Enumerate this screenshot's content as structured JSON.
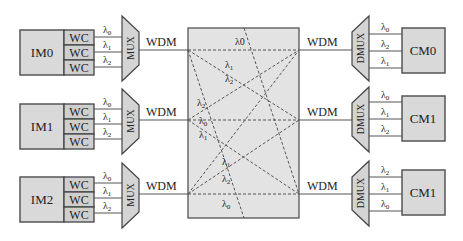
{
  "diagram": {
    "type": "optical-switch-architecture",
    "crossbar": {
      "fill": "#e3e3e3"
    },
    "inputs": [
      {
        "module": "IM0",
        "converters": [
          "WC",
          "WC",
          "WC"
        ],
        "wavelengths": [
          "λ0",
          "λ1",
          "λ2"
        ],
        "mux": "MUX",
        "link": "WDM"
      },
      {
        "module": "IM1",
        "converters": [
          "WC",
          "WC",
          "WC"
        ],
        "wavelengths": [
          "λ0",
          "λ1",
          "λ2"
        ],
        "mux": "MUX",
        "link": "WDM"
      },
      {
        "module": "IM2",
        "converters": [
          "WC",
          "WC",
          "WC"
        ],
        "wavelengths": [
          "λ0",
          "λ1",
          "λ2"
        ],
        "mux": "MUX",
        "link": "WDM"
      }
    ],
    "outputs": [
      {
        "module": "CM0",
        "demux": "DMUX",
        "link": "WDM",
        "wavelengths": [
          "λ0",
          "λ2",
          "λ1"
        ]
      },
      {
        "module": "CM1",
        "demux": "DMUX",
        "link": "WDM",
        "wavelengths": [
          "λ0",
          "λ1",
          "λ2"
        ]
      },
      {
        "module": "CM1",
        "demux": "DMUX",
        "link": "WDM",
        "wavelengths": [
          "λ2",
          "λ1",
          "λ0"
        ]
      }
    ],
    "crossbar_labels": {
      "top_straight": "λ0",
      "top_diag_1": "λ1",
      "top_diag_2": "λ2",
      "mid_left_upper": "λ2",
      "mid_straight": "λ0",
      "mid_left_lower": "λ1",
      "bot_diag_1": "λ1",
      "bot_diag_2": "λ2",
      "bot_straight": "λ0"
    }
  }
}
